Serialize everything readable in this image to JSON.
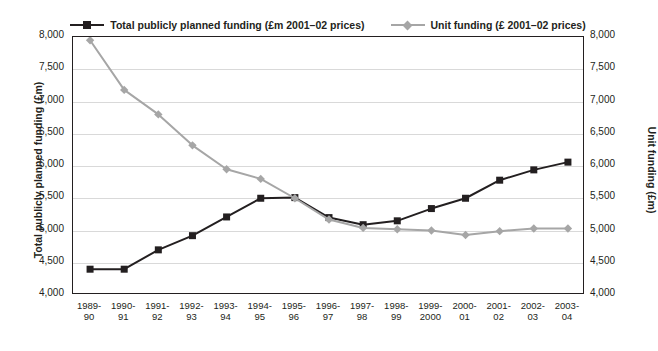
{
  "chart_data": {
    "type": "line",
    "title": "",
    "xlabel": "",
    "categories": [
      "1989-\n90",
      "1990-\n91",
      "1991-\n92",
      "1992-\n93",
      "1993-\n94",
      "1994-\n95",
      "1995-\n96",
      "1996-\n97",
      "1997-\n98",
      "1998-\n99",
      "1999-\n2000",
      "2000-\n01",
      "2001-\n02",
      "2002-\n03",
      "2003-\n04"
    ],
    "x_tick_lines": [
      [
        "1989-",
        "90"
      ],
      [
        "1990-",
        "91"
      ],
      [
        "1991-",
        "92"
      ],
      [
        "1992-",
        "93"
      ],
      [
        "1993-",
        "94"
      ],
      [
        "1994-",
        "95"
      ],
      [
        "1995-",
        "96"
      ],
      [
        "1996-",
        "97"
      ],
      [
        "1997-",
        "98"
      ],
      [
        "1998-",
        "99"
      ],
      [
        "1999-",
        "2000"
      ],
      [
        "2000-",
        "01"
      ],
      [
        "2001-",
        "02"
      ],
      [
        "2002-",
        "03"
      ],
      [
        "2003-",
        "04"
      ]
    ],
    "grid": true,
    "legend_position": "top",
    "series": [
      {
        "name": "Total publicly planned funding (£m 2001–02 prices)",
        "axis": "left",
        "color": "#231f20",
        "marker": "square",
        "values": [
          4400,
          4400,
          4700,
          4920,
          5210,
          5500,
          5510,
          5200,
          5090,
          5150,
          5340,
          5500,
          5780,
          5940,
          6060
        ]
      },
      {
        "name": "Unit funding (£ 2001–02 prices)",
        "axis": "right",
        "color": "#a6a6a6",
        "marker": "diamond",
        "values": [
          7950,
          7180,
          6800,
          6320,
          5950,
          5800,
          5500,
          5170,
          5040,
          5020,
          5000,
          4930,
          4990,
          5030,
          5030
        ]
      }
    ],
    "left_axis": {
      "title": "Total publicly planned funding (£m)",
      "min": 4000,
      "max": 8000,
      "ticks": [
        "4,000",
        "4,500",
        "5,000",
        "5,500",
        "6,000",
        "6,500",
        "7,000",
        "7,500",
        "8,000"
      ]
    },
    "right_axis": {
      "title": "Unit funding (£m)",
      "min": 4000,
      "max": 8000,
      "ticks": [
        "4,000",
        "4,500",
        "5,000",
        "5,500",
        "6,000",
        "6,500",
        "7,000",
        "7,500",
        "8,000"
      ]
    }
  },
  "legend": {
    "entries": [
      {
        "label": "Total publicly planned funding (£m 2001–02 prices)",
        "swatch": "sw-dark"
      },
      {
        "label": "Unit funding (£ 2001–02 prices)",
        "swatch": "sw-light"
      }
    ]
  }
}
